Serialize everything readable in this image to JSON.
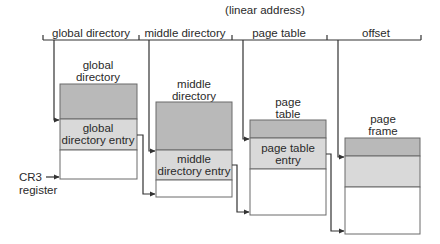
{
  "title": "(linear address)",
  "address_fields": [
    {
      "label": "global directory"
    },
    {
      "label": "middle directory"
    },
    {
      "label": "page table"
    },
    {
      "label": "offset"
    }
  ],
  "tables": [
    {
      "title_line1": "global",
      "title_line2": "directory",
      "entry_line1": "global",
      "entry_line2": "directory entry"
    },
    {
      "title_line1": "middle",
      "title_line2": "directory",
      "entry_line1": "middle",
      "entry_line2": "directory entry"
    },
    {
      "title_line1": "page",
      "title_line2": "table",
      "entry_line1": "page table",
      "entry_line2": "entry"
    },
    {
      "title_line1": "page",
      "title_line2": "frame",
      "entry_line1": "",
      "entry_line2": ""
    }
  ],
  "register": {
    "line1": "CR3",
    "line2": "register"
  },
  "colors": {
    "dark_region": "#b9b9b9",
    "entry_region": "#d9d9d9",
    "empty_region": "#ffffff",
    "lines": "#333333"
  }
}
